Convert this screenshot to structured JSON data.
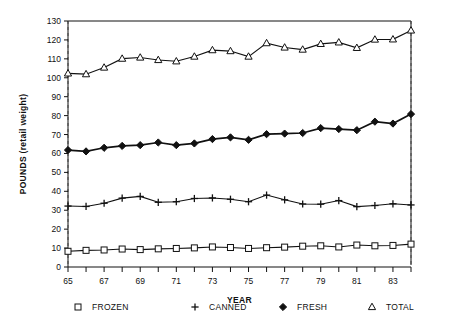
{
  "chart_data": {
    "type": "line",
    "title": "",
    "xlabel": "YEAR",
    "ylabel": "POUNDS (retail weight)",
    "ylim": [
      0,
      130
    ],
    "ytick_step": 10,
    "yticks": [
      0,
      10,
      20,
      30,
      40,
      50,
      60,
      70,
      80,
      90,
      100,
      110,
      120,
      130
    ],
    "ytick_labels": [
      "0",
      "10",
      "20",
      "30",
      "40",
      "50",
      "60",
      "70",
      "80",
      "90",
      "100",
      "110",
      "120",
      "130"
    ],
    "x": [
      65,
      66,
      67,
      68,
      69,
      70,
      71,
      72,
      73,
      74,
      75,
      76,
      77,
      78,
      79,
      80,
      81,
      82,
      83,
      84
    ],
    "xtick_labels_shown": [
      "65",
      "67",
      "69",
      "71",
      "73",
      "75",
      "77",
      "79",
      "81",
      "83"
    ],
    "xtick_years_shown": [
      65,
      67,
      69,
      71,
      73,
      75,
      77,
      79,
      81,
      83
    ],
    "xlim": [
      65,
      84
    ],
    "grid": false,
    "legend_position": "bottom",
    "series": [
      {
        "name": "FROZEN",
        "marker": "square",
        "values": [
          8.3,
          8.8,
          9.0,
          9.5,
          9.2,
          9.6,
          9.8,
          10.1,
          10.6,
          10.3,
          9.8,
          10.2,
          10.5,
          11.0,
          11.2,
          10.6,
          11.6,
          11.2,
          11.4,
          12.1
        ]
      },
      {
        "name": "CANNED",
        "marker": "plus",
        "values": [
          32.2,
          32.0,
          33.7,
          36.4,
          37.3,
          34.2,
          34.5,
          36.2,
          36.5,
          35.8,
          34.5,
          38.0,
          35.5,
          33.3,
          33.2,
          35.1,
          31.9,
          32.5,
          33.4,
          32.8
        ]
      },
      {
        "name": "FRESH",
        "marker": "diamond",
        "values": [
          61.8,
          61.1,
          63.0,
          64.0,
          64.4,
          65.8,
          64.4,
          65.3,
          67.6,
          68.5,
          67.2,
          70.2,
          70.5,
          70.8,
          73.4,
          72.9,
          72.3,
          76.8,
          75.8,
          80.8
        ]
      },
      {
        "name": "TOTAL",
        "marker": "triangle",
        "values": [
          102.3,
          101.9,
          105.4,
          110.1,
          110.7,
          109.4,
          108.7,
          111.2,
          114.6,
          114.1,
          111.2,
          118.3,
          116.0,
          114.9,
          117.9,
          118.7,
          115.8,
          120.2,
          120.3,
          125.0
        ]
      }
    ]
  },
  "legend": {
    "items": [
      {
        "label": "FROZEN",
        "marker_icon": "square-marker-icon"
      },
      {
        "label": "CANNED",
        "marker_icon": "plus-marker-icon"
      },
      {
        "label": "FRESH",
        "marker_icon": "diamond-marker-icon"
      },
      {
        "label": "TOTAL",
        "marker_icon": "triangle-marker-icon"
      }
    ]
  },
  "colors": {
    "ink": "#111111",
    "frame_dash": "#777777",
    "background": "#ffffff"
  }
}
